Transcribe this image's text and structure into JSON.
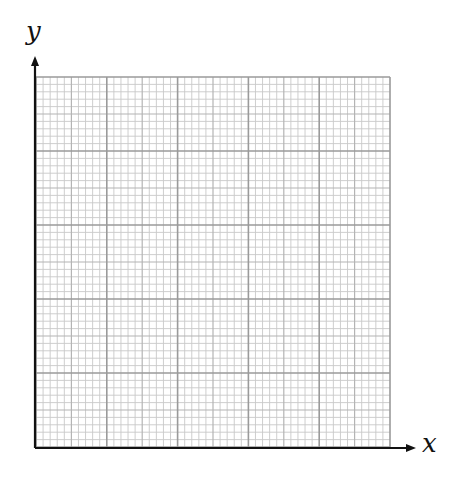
{
  "diagram": {
    "type": "graph-paper-axes",
    "axes": {
      "x_label": "x",
      "y_label": "y"
    },
    "grid": {
      "left": 36,
      "top": 77,
      "right": 390,
      "bottom": 447,
      "major_divisions_x": 5,
      "major_divisions_y": 5,
      "minor_per_major": 10,
      "colors": {
        "minor": "#c8c8c8",
        "medium": "#b4b4b4",
        "major": "#9a9a9a",
        "axis": "#111111"
      }
    }
  }
}
